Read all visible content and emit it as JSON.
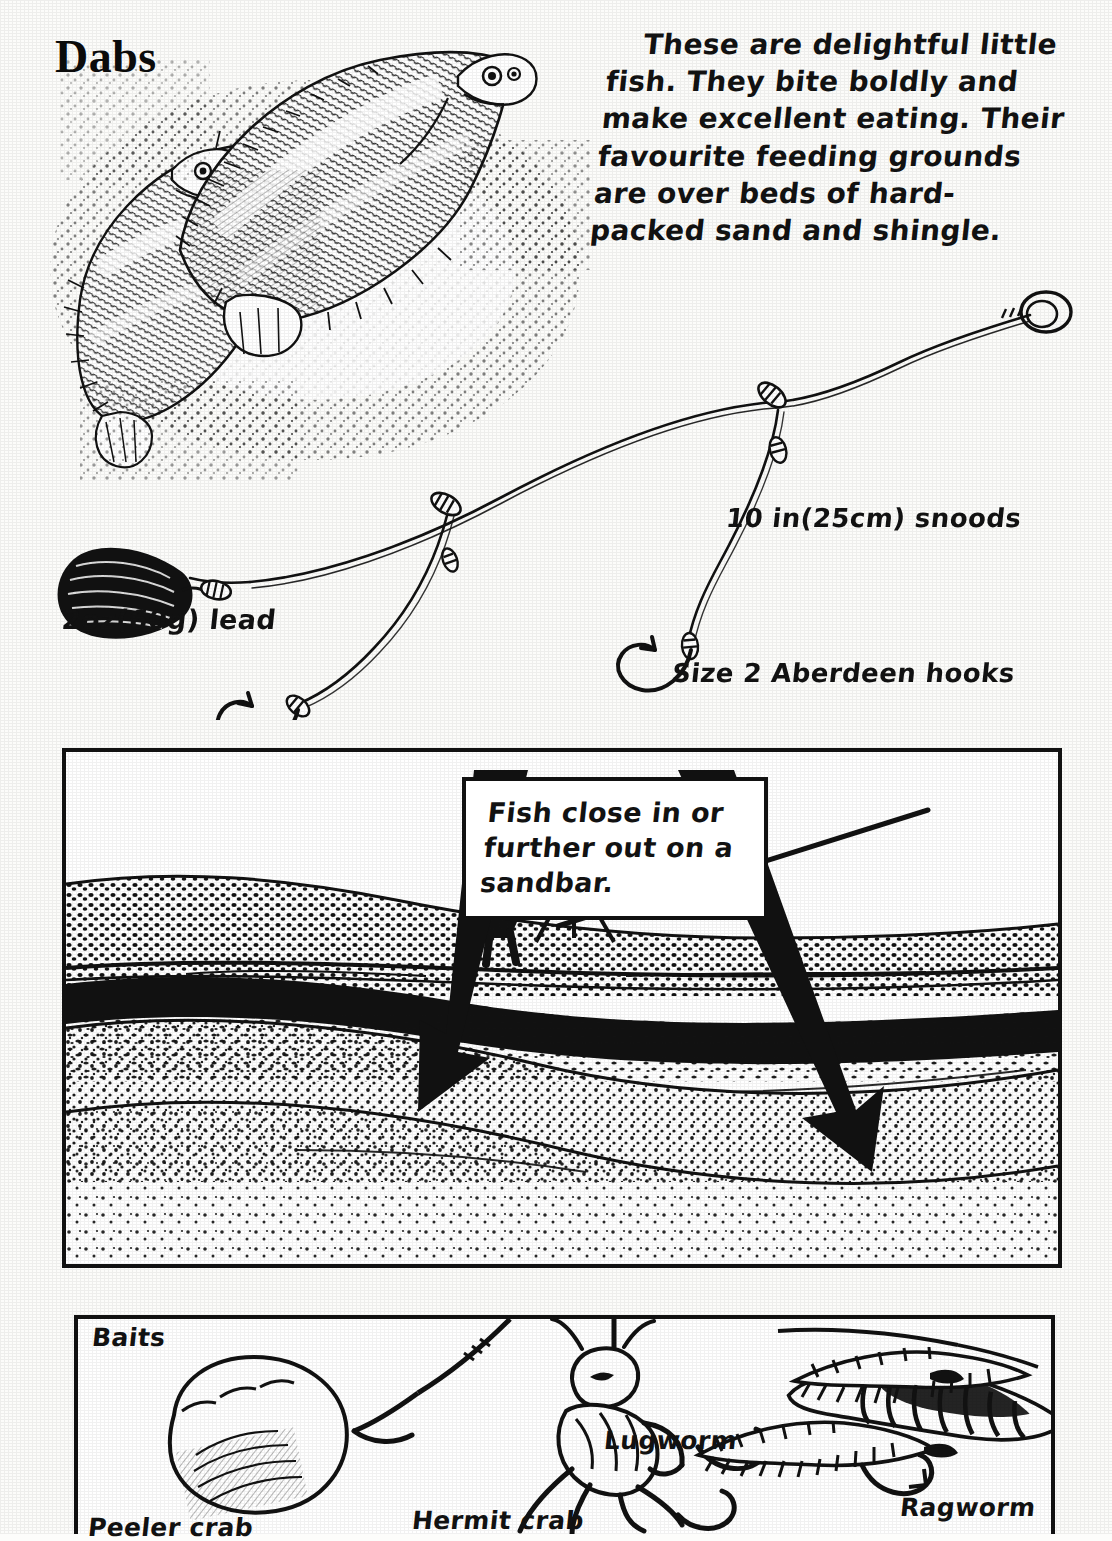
{
  "page": {
    "title": "Dabs",
    "background_color": "#fcfcfa",
    "ink_color": "#111111"
  },
  "intro": {
    "text": "These are delightful little fish. They bite boldly and make excellent eating. Their favourite feeding grounds are over beds of hard-packed sand and shingle."
  },
  "rig_diagram": {
    "name": "dab-paternoster-rig",
    "labels": {
      "lead": "2oz(60g) lead",
      "snoods": "10 in(25cm) snoods",
      "hooks": "Size 2 Aberdeen hooks"
    }
  },
  "beach_panel": {
    "name": "beach-cross-section",
    "callout": {
      "text": "Fish close in or further out on a sandbar.",
      "lines": [
        "Fish close in or",
        "further out on",
        "a sandbar."
      ]
    },
    "features": [
      "angler",
      "rod-rest",
      "shingle-bank",
      "sea-surface",
      "sandbar",
      "seabed"
    ]
  },
  "baits_panel": {
    "heading": "Baits",
    "items": [
      {
        "label": "Peeler crab",
        "name": "bait-peeler-crab"
      },
      {
        "label": "Hermit crab",
        "name": "bait-hermit-crab"
      },
      {
        "label": "Lugworm",
        "name": "bait-lugworm"
      },
      {
        "label": "Ragworm",
        "name": "bait-ragworm"
      }
    ]
  }
}
